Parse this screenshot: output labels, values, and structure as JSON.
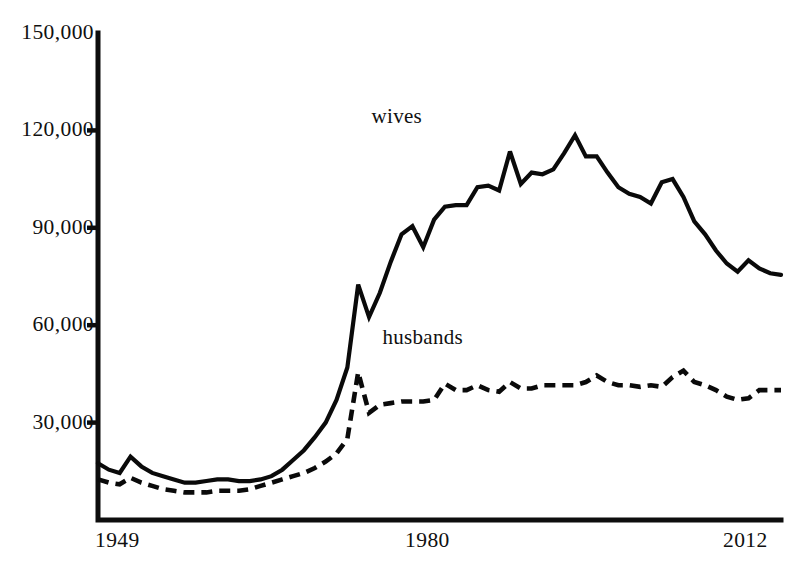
{
  "chart_data": {
    "type": "line",
    "title": "",
    "subtitle": "",
    "xlabel": "",
    "ylabel": "",
    "xlim": [
      1949,
      2012
    ],
    "ylim": [
      0,
      150000
    ],
    "grid": false,
    "legend_position": "inline-annotation",
    "y_ticks": [
      "150,000",
      "120,000",
      "90,000",
      "60,000",
      "30,000"
    ],
    "y_tick_values": [
      150000,
      120000,
      90000,
      60000,
      30000
    ],
    "x_ticks": [
      "1949",
      "1980",
      "2012"
    ],
    "x_tick_values": [
      1949,
      1980,
      2012
    ],
    "annotations": [
      {
        "name": "wives-label",
        "text": "wives",
        "x": 1977,
        "y": 124000
      },
      {
        "name": "husbands-label",
        "text": "husbands",
        "x": 1978,
        "y": 56000
      }
    ],
    "x": [
      1949,
      1950,
      1951,
      1952,
      1953,
      1954,
      1955,
      1956,
      1957,
      1958,
      1959,
      1960,
      1961,
      1962,
      1963,
      1964,
      1965,
      1966,
      1967,
      1968,
      1969,
      1970,
      1971,
      1972,
      1973,
      1974,
      1975,
      1976,
      1977,
      1978,
      1979,
      1980,
      1981,
      1982,
      1983,
      1984,
      1985,
      1986,
      1987,
      1988,
      1989,
      1990,
      1991,
      1992,
      1993,
      1994,
      1995,
      1996,
      1997,
      1998,
      1999,
      2000,
      2001,
      2002,
      2003,
      2004,
      2005,
      2006,
      2007,
      2008,
      2009,
      2010,
      2011,
      2012
    ],
    "series": [
      {
        "name": "wives",
        "style": "solid",
        "values": [
          17500,
          15500,
          14500,
          19500,
          16500,
          14500,
          13500,
          12500,
          11500,
          11500,
          12000,
          12500,
          12500,
          12000,
          12000,
          12500,
          13500,
          15500,
          18500,
          21500,
          25500,
          30000,
          37000,
          47000,
          72500,
          62500,
          70000,
          79500,
          88000,
          90500,
          84000,
          92500,
          96500,
          97000,
          97000,
          102500,
          103000,
          101500,
          113500,
          103500,
          107000,
          106500,
          108000,
          113000,
          118500,
          112000,
          112000,
          107000,
          102500,
          100500,
          99500,
          97500,
          104000,
          105000,
          99500,
          92000,
          88000,
          83000,
          79000,
          76500,
          80000,
          77500,
          76000,
          75500
        ]
      },
      {
        "name": "husbands",
        "style": "dashed",
        "values": [
          12500,
          11500,
          11000,
          13000,
          11500,
          10500,
          9500,
          9000,
          8500,
          8500,
          8500,
          9000,
          9000,
          9000,
          9500,
          10500,
          11500,
          12500,
          13500,
          14500,
          16000,
          18000,
          20500,
          25000,
          45500,
          33000,
          35500,
          36000,
          36500,
          36500,
          36500,
          37000,
          42000,
          40000,
          40000,
          41500,
          40000,
          39500,
          42500,
          40500,
          40500,
          41500,
          41500,
          41500,
          41500,
          42500,
          44500,
          42500,
          41500,
          41500,
          41000,
          41500,
          41000,
          44000,
          46000,
          42500,
          41500,
          40000,
          38000,
          37000,
          37500,
          40000,
          40000,
          40000
        ]
      }
    ]
  },
  "geometry": {
    "plot_left": 98,
    "plot_right": 781,
    "plot_bottom": 520,
    "plot_top": 33,
    "y_axis_max": 150000
  }
}
